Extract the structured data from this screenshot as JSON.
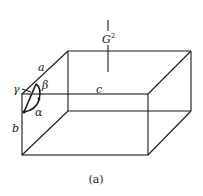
{
  "figure": {
    "caption": "(a)",
    "labels": {
      "axis_a": "a",
      "axis_b": "b",
      "axis_c": "c",
      "angle_alpha": "α",
      "angle_beta": "β",
      "angle_gamma": "γ",
      "top_symbol": "G",
      "top_symbol_sup": "2"
    }
  }
}
